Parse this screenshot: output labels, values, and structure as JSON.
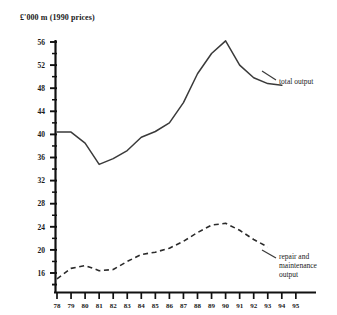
{
  "chart_data": {
    "type": "line",
    "title": "£'000 m  (1990 prices)",
    "xlabel": "",
    "ylabel": "£'000 m (1990 prices)",
    "xlim": [
      78,
      95
    ],
    "ylim": [
      16,
      56
    ],
    "ytick_step": 4,
    "yticks_minor_step": 2,
    "grid": false,
    "legend_position": "right-inline-labels",
    "x": [
      78,
      79,
      80,
      81,
      82,
      83,
      84,
      85,
      86,
      87,
      88,
      89,
      90,
      91,
      92,
      93,
      94,
      95
    ],
    "xtick_labels": [
      "78",
      "79",
      "80",
      "81",
      "82",
      "83",
      "84",
      "85",
      "86",
      "87",
      "88",
      "89",
      "90",
      "91",
      "92",
      "93",
      "94",
      "95"
    ],
    "ytick_labels": [
      "16",
      "20",
      "24",
      "28",
      "32",
      "36",
      "40",
      "44",
      "48",
      "52",
      "56"
    ],
    "series": [
      {
        "name": "total output",
        "style": "solid",
        "x": [
          78,
          79,
          80,
          81,
          82,
          83,
          84,
          85,
          86,
          87,
          88,
          89,
          90,
          91,
          92,
          93,
          94
        ],
        "values": [
          40.4,
          40.4,
          38.5,
          34.8,
          35.8,
          37.2,
          39.5,
          40.5,
          42.0,
          45.5,
          50.5,
          54.0,
          56.2,
          52.0,
          49.8,
          48.8,
          48.5
        ]
      },
      {
        "name": "repair and maintenance output",
        "style": "dashed",
        "x": [
          78,
          79,
          80,
          81,
          82,
          83,
          84,
          85,
          86,
          87,
          88,
          89,
          90,
          91,
          92,
          93
        ],
        "values": [
          15.0,
          16.8,
          17.3,
          16.4,
          16.6,
          18.0,
          19.2,
          19.6,
          20.3,
          21.5,
          23.0,
          24.3,
          24.6,
          23.4,
          21.8,
          20.5
        ]
      }
    ]
  },
  "labels": {
    "total_output": "total output",
    "repair_line_1": "repair and",
    "repair_line_2": "maintenance",
    "repair_line_3": "output"
  },
  "colors": {
    "axis": "#111111",
    "total_output_line": "#3a3a3a",
    "repair_line": "#2b2b2b",
    "background": "#ffffff",
    "text": "#1a1a1a"
  }
}
